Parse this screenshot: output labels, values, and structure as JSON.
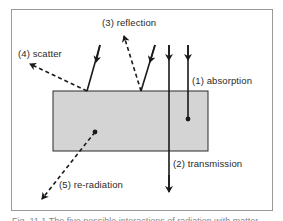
{
  "diagram": {
    "colors": {
      "frame": "#9a9a9a",
      "block_fill": "#d4d4d4",
      "block_stroke": "#2a2a2a",
      "line": "#1a1a1a",
      "text": "#2a2a2a"
    },
    "labels": {
      "absorption": "(1)  absorption",
      "transmission": "(2)  transmission",
      "reflection": "(3)  reflection",
      "scatter": "(4)  scatter",
      "reradiation": "(5)  re-radiation"
    },
    "caption": "Fig. 11.1  The five possible interactions of radiation with matter"
  }
}
